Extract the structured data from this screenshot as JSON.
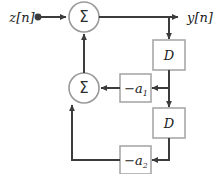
{
  "diagram": {
    "type": "signal-flow-block-diagram",
    "input": {
      "label": "z[n]",
      "name": "input-signal-label"
    },
    "output": {
      "label": "y[n]",
      "name": "output-signal-label"
    },
    "adders": [
      {
        "id": "adder-top",
        "symbol": "Σ"
      },
      {
        "id": "adder-bottom",
        "symbol": "Σ"
      }
    ],
    "delays": [
      {
        "id": "delay-1",
        "label": "D"
      },
      {
        "id": "delay-2",
        "label": "D"
      }
    ],
    "coefficients": [
      {
        "id": "coef-a1",
        "prefix": "−a",
        "subscript": "1"
      },
      {
        "id": "coef-a2",
        "prefix": "−a",
        "subscript": "2"
      }
    ],
    "colors": {
      "wire": "#3c3c3c",
      "node_border": "#9a9a9a",
      "block_border": "#a8a8a8",
      "background": "#ffffff",
      "text": "#1a1a1a"
    }
  }
}
